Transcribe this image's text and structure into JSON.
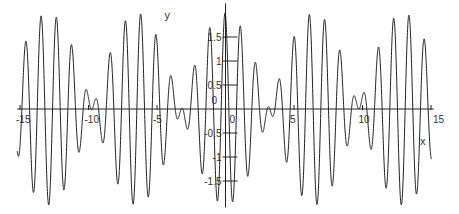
{
  "chart_data": {
    "type": "line",
    "title": "",
    "xlabel": "x",
    "ylabel": "y",
    "xlim": [
      -15.4,
      15.4
    ],
    "ylim": [
      -2.05,
      2.2
    ],
    "grid": false,
    "x_ticks": [
      -15,
      -10,
      -5,
      0,
      5,
      10,
      15
    ],
    "x_tick_labels": [
      "-15",
      "-10",
      "-5",
      "0",
      "5",
      "10",
      "15"
    ],
    "y_ticks": [
      -1.5,
      -1,
      -0.5,
      0,
      0.5,
      1,
      1.5
    ],
    "y_tick_labels": [
      "-1.5",
      "-1",
      "-0.5",
      "0",
      "0.5",
      "1",
      "1.5"
    ],
    "series": [
      {
        "name": "y",
        "function": "cos(6.1x+0.2)+cos(5.13x+0.2)",
        "x_range": [
          -15,
          15
        ],
        "peak_amplitude": 2,
        "beat_nodes_x": [
          -10.3,
          -3.8,
          2.7,
          9.2
        ]
      }
    ]
  }
}
